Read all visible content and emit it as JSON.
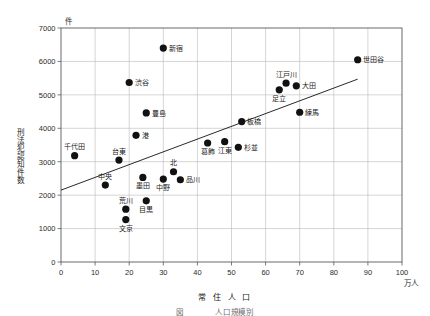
{
  "chart_data": {
    "type": "scatter",
    "title": "",
    "xlabel": "常 住 人 口",
    "ylabel": "刑法犯認知件数",
    "x_unit": "万人",
    "y_unit": "件",
    "xlim": [
      0,
      100
    ],
    "ylim": [
      0,
      7000
    ],
    "xticks": [
      0,
      10,
      20,
      30,
      40,
      50,
      60,
      70,
      80,
      90,
      100
    ],
    "yticks": [
      0,
      1000,
      2000,
      3000,
      4000,
      5000,
      6000,
      7000
    ],
    "grid": true,
    "legend": "none",
    "marker_color": "#111111",
    "points": [
      {
        "label": "千代田",
        "x": 4,
        "y": 3180,
        "label_pos": "above"
      },
      {
        "label": "台東",
        "x": 17,
        "y": 3050,
        "label_pos": "above"
      },
      {
        "label": "中央",
        "x": 13,
        "y": 2300,
        "label_pos": "above"
      },
      {
        "label": "渋谷",
        "x": 20,
        "y": 5370,
        "label_pos": "right"
      },
      {
        "label": "荒川",
        "x": 19,
        "y": 1580,
        "label_pos": "above"
      },
      {
        "label": "文京",
        "x": 19,
        "y": 1270,
        "label_pos": "below"
      },
      {
        "label": "墨田",
        "x": 24,
        "y": 2530,
        "label_pos": "below"
      },
      {
        "label": "目黒",
        "x": 25,
        "y": 1830,
        "label_pos": "below"
      },
      {
        "label": "豊島",
        "x": 25,
        "y": 4460,
        "label_pos": "right"
      },
      {
        "label": "港",
        "x": 22,
        "y": 3790,
        "label_pos": "right"
      },
      {
        "label": "新宿",
        "x": 30,
        "y": 6400,
        "label_pos": "right"
      },
      {
        "label": "中野",
        "x": 30,
        "y": 2480,
        "label_pos": "below"
      },
      {
        "label": "北",
        "x": 33,
        "y": 2700,
        "label_pos": "above"
      },
      {
        "label": "品川",
        "x": 35,
        "y": 2460,
        "label_pos": "right"
      },
      {
        "label": "葛飾",
        "x": 43,
        "y": 3560,
        "label_pos": "below"
      },
      {
        "label": "江東",
        "x": 48,
        "y": 3600,
        "label_pos": "below"
      },
      {
        "label": "杉並",
        "x": 52,
        "y": 3430,
        "label_pos": "right"
      },
      {
        "label": "板橋",
        "x": 53,
        "y": 4200,
        "label_pos": "right"
      },
      {
        "label": "練馬",
        "x": 70,
        "y": 4480,
        "label_pos": "right"
      },
      {
        "label": "足立",
        "x": 64,
        "y": 5150,
        "label_pos": "below"
      },
      {
        "label": "江戸川",
        "x": 66,
        "y": 5350,
        "label_pos": "above"
      },
      {
        "label": "大田",
        "x": 69,
        "y": 5270,
        "label_pos": "right"
      },
      {
        "label": "世田谷",
        "x": 87,
        "y": 6050,
        "label_pos": "right"
      }
    ],
    "trendline": {
      "x0": 0,
      "y0": 2150,
      "x1": 87,
      "y1": 5470
    }
  },
  "caption": {
    "text": "図　　　　人口規模別　　　　　　　　　　　　"
  }
}
